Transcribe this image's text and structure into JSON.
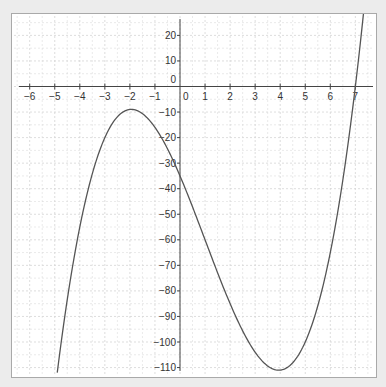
{
  "chart_data": {
    "type": "line",
    "title": "",
    "xlabel": "",
    "ylabel": "",
    "function": "f(x) = x^3 - 3x^2 - 23x - 35",
    "series": [
      {
        "name": "f(x)",
        "color": "#555555",
        "x_range": [
          -4.9,
          7.35
        ],
        "points": [
          {
            "x": -4.9,
            "y": -112.0
          },
          {
            "x": -4.0,
            "y": -55.0
          },
          {
            "x": -3.0,
            "y": -20.0
          },
          {
            "x": -2.0,
            "y": -9.0
          },
          {
            "x": -1.0,
            "y": -16.0
          },
          {
            "x": 0.0,
            "y": -35.0
          },
          {
            "x": 1.0,
            "y": -60.0
          },
          {
            "x": 2.0,
            "y": -85.0
          },
          {
            "x": 3.0,
            "y": -104.0
          },
          {
            "x": 4.0,
            "y": -111.0
          },
          {
            "x": 5.0,
            "y": -100.0
          },
          {
            "x": 6.0,
            "y": -65.0
          },
          {
            "x": 7.0,
            "y": 0.0
          },
          {
            "x": 7.35,
            "y": 30.9
          }
        ],
        "local_max": {
          "x": -2,
          "y": -9
        },
        "local_min": {
          "x": 4,
          "y": -111
        },
        "root": 7
      }
    ],
    "x_ticks": [
      -6,
      -5,
      -4,
      -3,
      -2,
      -1,
      0,
      1,
      2,
      3,
      4,
      5,
      6,
      7
    ],
    "x_tick_labels": [
      "−6",
      "−5",
      "−4",
      "−3",
      "−2",
      "−1",
      "0",
      "1",
      "2",
      "3",
      "4",
      "5",
      "6",
      "7"
    ],
    "y_ticks": [
      20,
      10,
      0,
      -10,
      -20,
      -30,
      -40,
      -50,
      -60,
      -70,
      -80,
      -90,
      -100,
      -110
    ],
    "y_tick_labels": [
      "20",
      "10",
      "0",
      "−10",
      "−20",
      "−30",
      "−40",
      "−50",
      "−60",
      "−70",
      "−80",
      "−90",
      "−100",
      "−110"
    ],
    "xlim": [
      -6.8,
      7.8
    ],
    "ylim": [
      -113,
      26
    ],
    "grid": true,
    "legend": null
  },
  "layout": {
    "origin_px": [
      168,
      72.5
    ],
    "px_per_x_unit": 25.05,
    "px_per_y_unit": 2.555,
    "x_axis_px_range": [
      7,
      361
    ],
    "y_axis_px_range": [
      5,
      357
    ],
    "colors": {
      "curve": "#555555",
      "axis": "#444444",
      "grid": "#d4d4d4",
      "frame_border": "#a9a9a9",
      "background": "#ececec"
    }
  }
}
